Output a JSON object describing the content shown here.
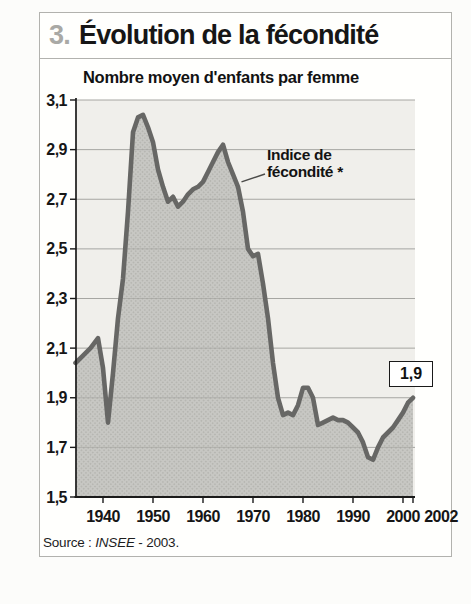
{
  "page": {
    "figure_number": "3.",
    "title": "Évolution de la fécondité"
  },
  "chart_data": {
    "type": "area",
    "title": "Nombre moyen d'enfants par femme",
    "xlabel": "",
    "ylabel": "Nombre moyen d'enfants par femme",
    "xlim": [
      1934.5,
      2002
    ],
    "ylim": [
      1.5,
      3.1
    ],
    "grid": true,
    "yticks": [
      {
        "value": 3.1,
        "label": "3,1"
      },
      {
        "value": 2.9,
        "label": "2,9"
      },
      {
        "value": 2.7,
        "label": "2,7"
      },
      {
        "value": 2.5,
        "label": "2,5"
      },
      {
        "value": 2.3,
        "label": "2,3"
      },
      {
        "value": 2.1,
        "label": "2,1"
      },
      {
        "value": 1.9,
        "label": "1,9"
      },
      {
        "value": 1.7,
        "label": "1,7"
      },
      {
        "value": 1.5,
        "label": "1,5"
      }
    ],
    "xticks": [
      {
        "value": 1940,
        "label": "1940"
      },
      {
        "value": 1950,
        "label": "1950"
      },
      {
        "value": 1960,
        "label": "1960"
      },
      {
        "value": 1970,
        "label": "1970"
      },
      {
        "value": 1980,
        "label": "1980"
      },
      {
        "value": 1990,
        "label": "1990"
      },
      {
        "value": 2000,
        "label": "2000"
      },
      {
        "value": 2002,
        "label": "2002"
      }
    ],
    "series": [
      {
        "name": "Indice de fécondité *",
        "points": [
          [
            1934.5,
            2.04
          ],
          [
            1936,
            2.07
          ],
          [
            1937.5,
            2.1
          ],
          [
            1939,
            2.14
          ],
          [
            1940,
            2.02
          ],
          [
            1941,
            1.8
          ],
          [
            1942,
            2.0
          ],
          [
            1943,
            2.22
          ],
          [
            1944,
            2.38
          ],
          [
            1945,
            2.65
          ],
          [
            1946,
            2.97
          ],
          [
            1947,
            3.03
          ],
          [
            1948,
            3.04
          ],
          [
            1949,
            2.99
          ],
          [
            1950,
            2.93
          ],
          [
            1951,
            2.82
          ],
          [
            1952,
            2.75
          ],
          [
            1953,
            2.69
          ],
          [
            1954,
            2.71
          ],
          [
            1955,
            2.67
          ],
          [
            1956,
            2.69
          ],
          [
            1957,
            2.72
          ],
          [
            1958,
            2.74
          ],
          [
            1959,
            2.75
          ],
          [
            1960,
            2.77
          ],
          [
            1961,
            2.81
          ],
          [
            1962,
            2.85
          ],
          [
            1963,
            2.89
          ],
          [
            1964,
            2.92
          ],
          [
            1965,
            2.85
          ],
          [
            1966,
            2.8
          ],
          [
            1967,
            2.75
          ],
          [
            1968,
            2.65
          ],
          [
            1969,
            2.5
          ],
          [
            1970,
            2.47
          ],
          [
            1971,
            2.48
          ],
          [
            1972,
            2.36
          ],
          [
            1973,
            2.22
          ],
          [
            1974,
            2.04
          ],
          [
            1975,
            1.9
          ],
          [
            1976,
            1.83
          ],
          [
            1977,
            1.84
          ],
          [
            1978,
            1.83
          ],
          [
            1979,
            1.87
          ],
          [
            1980,
            1.94
          ],
          [
            1981,
            1.94
          ],
          [
            1982,
            1.9
          ],
          [
            1983,
            1.79
          ],
          [
            1984,
            1.8
          ],
          [
            1985,
            1.81
          ],
          [
            1986,
            1.82
          ],
          [
            1987,
            1.81
          ],
          [
            1988,
            1.81
          ],
          [
            1989,
            1.8
          ],
          [
            1990,
            1.78
          ],
          [
            1991,
            1.76
          ],
          [
            1992,
            1.72
          ],
          [
            1993,
            1.66
          ],
          [
            1994,
            1.65
          ],
          [
            1995,
            1.7
          ],
          [
            1996,
            1.74
          ],
          [
            1997,
            1.76
          ],
          [
            1998,
            1.78
          ],
          [
            1999,
            1.81
          ],
          [
            2000,
            1.84
          ],
          [
            2001,
            1.88
          ],
          [
            2002,
            1.9
          ]
        ]
      }
    ],
    "annotation": {
      "line1": "Indice de",
      "line2": "fécondité *",
      "target": {
        "year": 1967.5,
        "value": 2.76
      }
    },
    "end_value_label": "1,9",
    "colors": {
      "line": "#676765",
      "fill_base": "#c7c7c3",
      "fill_dot": "#b0b0ab",
      "plot_bg": "#f0efeb",
      "grid": "#a6a6a2",
      "axis": "#1a1a1a"
    }
  },
  "source": {
    "prefix": "Source : ",
    "name": "INSEE",
    "suffix": " - 2003."
  }
}
